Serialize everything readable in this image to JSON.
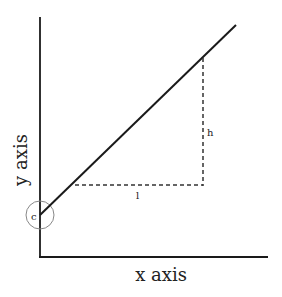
{
  "diagram": {
    "x_axis_label": "x axis",
    "y_axis_label": "y axis",
    "intercept_label": "c",
    "run_label": "l",
    "rise_label": "h",
    "colors": {
      "line": "#1a1a1a",
      "axis": "#1a1a1a",
      "dashed": "#333333",
      "circle": "#888888",
      "text": "#222222"
    }
  }
}
